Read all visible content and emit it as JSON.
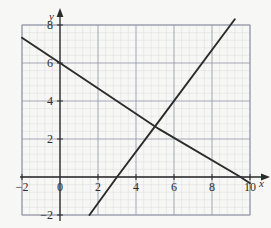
{
  "chart_data": {
    "type": "line",
    "title": "",
    "xlabel": "x",
    "ylabel": "y",
    "xlim": [
      -2,
      10
    ],
    "ylim": [
      -2,
      8
    ],
    "grid": true,
    "minor_grid": true,
    "minor_step": 0.4,
    "legend": "none",
    "x_ticks": [
      -2,
      0,
      2,
      4,
      6,
      8,
      10
    ],
    "y_ticks": [
      -2,
      0,
      2,
      4,
      6,
      8
    ],
    "x_tick_labels": [
      "-2",
      "0",
      "2",
      "4",
      "6",
      "8",
      "10"
    ],
    "y_tick_labels": [
      "-2",
      "0",
      "2",
      "4",
      "6",
      "8"
    ],
    "axis_arrows": [
      "x-positive",
      "y-positive"
    ],
    "intersection": {
      "x": 5.2,
      "y": 2.7
    },
    "series": [
      {
        "name": "descending-line",
        "color": "#2b2b2b",
        "slope": -0.6667,
        "intercept": 6,
        "x_intercept": 9.5,
        "y_intercept": 6,
        "points": [
          [
            -2,
            7.33
          ],
          [
            0,
            6
          ],
          [
            5.2,
            2.53
          ],
          [
            9.5,
            0
          ],
          [
            10,
            -0.33
          ]
        ]
      },
      {
        "name": "ascending-line",
        "color": "#2b2b2b",
        "slope": 1.3333,
        "intercept": -4,
        "x_intercept": 3,
        "y_intercept": -4,
        "points": [
          [
            1.55,
            -2
          ],
          [
            3,
            0
          ],
          [
            5.2,
            2.93
          ],
          [
            9.2,
            8.3
          ]
        ]
      }
    ]
  },
  "labels": {
    "x_axis_name": "x",
    "y_axis_name": "y"
  }
}
